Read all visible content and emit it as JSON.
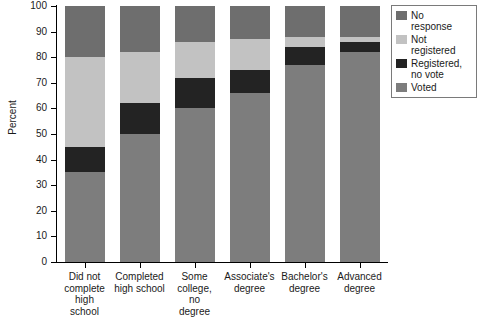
{
  "chart_data": {
    "type": "bar",
    "subtype": "stacked-bar-100",
    "title": "",
    "xlabel": "",
    "ylabel": "Percent",
    "ylim": [
      0,
      100
    ],
    "ytick_values": [
      0,
      10,
      20,
      30,
      40,
      50,
      60,
      70,
      80,
      90,
      100
    ],
    "ytick_labels": [
      "0",
      "10",
      "20",
      "30",
      "40",
      "50",
      "60",
      "70",
      "80",
      "90",
      "100"
    ],
    "grid": false,
    "legend_position": "top-right",
    "categories": [
      "Did not complete high school",
      "Completed high school",
      "Some college, no degree",
      "Associate's degree",
      "Bachelor's degree",
      "Advanced degree"
    ],
    "category_label_lines": [
      [
        "Did not",
        "complete",
        "high",
        "school"
      ],
      [
        "Completed",
        "high school"
      ],
      [
        "Some",
        "college,",
        "no",
        "degree"
      ],
      [
        "Associate's",
        "degree"
      ],
      [
        "Bachelor's",
        "degree"
      ],
      [
        "Advanced",
        "degree"
      ]
    ],
    "series": [
      {
        "name": "Voted",
        "color": "#7d7d7d",
        "values": [
          35,
          50,
          60,
          66,
          77,
          82
        ]
      },
      {
        "name": "Registered, no vote",
        "color": "#232323",
        "values": [
          10,
          12,
          12,
          9,
          7,
          4
        ]
      },
      {
        "name": "Not registered",
        "color": "#c2c2c2",
        "values": [
          35,
          20,
          14,
          12,
          4,
          2
        ]
      },
      {
        "name": "No response",
        "color": "#6e6e6e",
        "values": [
          20,
          18,
          14,
          13,
          12,
          12
        ]
      }
    ],
    "stack_order_bottom_to_top": [
      "Voted",
      "Registered, no vote",
      "Not registered",
      "No response"
    ],
    "legend_entries": [
      {
        "label_lines": [
          "No",
          "response"
        ],
        "label": "No response",
        "color": "#6e6e6e"
      },
      {
        "label_lines": [
          "Not",
          "registered"
        ],
        "label": "Not registered",
        "color": "#c2c2c2"
      },
      {
        "label_lines": [
          "Registered,",
          "no vote"
        ],
        "label": "Registered, no vote",
        "color": "#232323"
      },
      {
        "label_lines": [
          "Voted"
        ],
        "label": "Voted",
        "color": "#7d7d7d"
      }
    ]
  },
  "annotations": {
    "stray_mark": "∕"
  }
}
